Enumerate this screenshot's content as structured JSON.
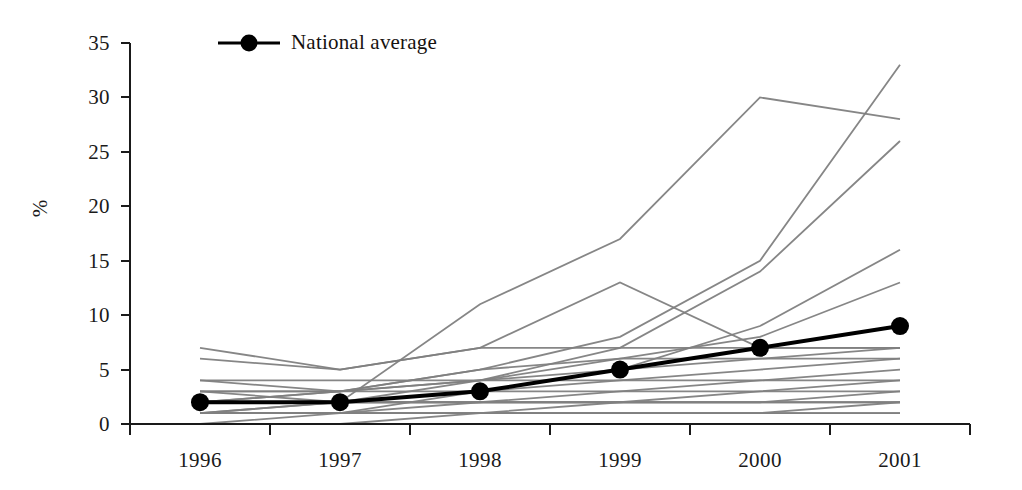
{
  "legend": {
    "position": "top-left-inside",
    "entries": [
      {
        "label": "National average",
        "color": "#000000",
        "marker": "filled-circle"
      }
    ]
  },
  "axes": {
    "ylabel": "%",
    "xlabel": "",
    "yticks": [
      "0",
      "5",
      "10",
      "15",
      "20",
      "25",
      "30",
      "35"
    ],
    "xticks": [
      "1996",
      "1997",
      "1998",
      "1999",
      "2000",
      "2001"
    ]
  },
  "chart_data": {
    "type": "line",
    "title": "",
    "subtitle": "",
    "xlabel": "",
    "ylabel": "%",
    "x": [
      "1996",
      "1997",
      "1998",
      "1999",
      "2000",
      "2001"
    ],
    "ylim": [
      0,
      35
    ],
    "xlim": [
      "1996",
      "2001"
    ],
    "ytick_step": 5,
    "grid": false,
    "legend_position": "top-left-inside",
    "annotations": [],
    "series": [
      {
        "name": "National average",
        "color": "#000000",
        "emphasis": "highlight",
        "marker": "filled-circle",
        "values": [
          2,
          2,
          3,
          5,
          7,
          9
        ]
      },
      {
        "name": "Region 1",
        "color": "#808080",
        "emphasis": "background",
        "marker": "none",
        "values": [
          1,
          2,
          11,
          17,
          30,
          28
        ]
      },
      {
        "name": "Region 2",
        "color": "#808080",
        "emphasis": "background",
        "marker": "none",
        "values": [
          2,
          3,
          5,
          8,
          15,
          33
        ]
      },
      {
        "name": "Region 3",
        "color": "#808080",
        "emphasis": "background",
        "marker": "none",
        "values": [
          3,
          3,
          4,
          7,
          14,
          26
        ]
      },
      {
        "name": "Region 4",
        "color": "#808080",
        "emphasis": "background",
        "marker": "none",
        "values": [
          1,
          1,
          3,
          5,
          9,
          16
        ]
      },
      {
        "name": "Region 5",
        "color": "#808080",
        "emphasis": "background",
        "marker": "none",
        "values": [
          2,
          2,
          4,
          6,
          8,
          13
        ]
      },
      {
        "name": "Region 6",
        "color": "#808080",
        "emphasis": "background",
        "marker": "none",
        "values": [
          7,
          5,
          7,
          13,
          7,
          7
        ]
      },
      {
        "name": "Region 7",
        "color": "#808080",
        "emphasis": "background",
        "marker": "none",
        "values": [
          6,
          5,
          7,
          7,
          7,
          7
        ]
      },
      {
        "name": "Region 8",
        "color": "#808080",
        "emphasis": "background",
        "marker": "none",
        "values": [
          4,
          3,
          5,
          6,
          6,
          6
        ]
      },
      {
        "name": "Region 9",
        "color": "#808080",
        "emphasis": "background",
        "marker": "none",
        "values": [
          4,
          4,
          4,
          5,
          6,
          7
        ]
      },
      {
        "name": "Region 10",
        "color": "#808080",
        "emphasis": "background",
        "marker": "none",
        "values": [
          3,
          3,
          4,
          4,
          5,
          6
        ]
      },
      {
        "name": "Region 11",
        "color": "#808080",
        "emphasis": "background",
        "marker": "none",
        "values": [
          3,
          2,
          3,
          4,
          4,
          5
        ]
      },
      {
        "name": "Region 12",
        "color": "#808080",
        "emphasis": "background",
        "marker": "none",
        "values": [
          2,
          3,
          3,
          3,
          4,
          4
        ]
      },
      {
        "name": "Region 13",
        "color": "#808080",
        "emphasis": "background",
        "marker": "none",
        "values": [
          2,
          2,
          2,
          3,
          3,
          4
        ]
      },
      {
        "name": "Region 14",
        "color": "#808080",
        "emphasis": "background",
        "marker": "none",
        "values": [
          2,
          2,
          2,
          2,
          2,
          3
        ]
      },
      {
        "name": "Region 15",
        "color": "#808080",
        "emphasis": "background",
        "marker": "none",
        "values": [
          1,
          2,
          2,
          2,
          3,
          3
        ]
      },
      {
        "name": "Region 16",
        "color": "#808080",
        "emphasis": "background",
        "marker": "none",
        "values": [
          1,
          1,
          2,
          2,
          2,
          2
        ]
      },
      {
        "name": "Region 17",
        "color": "#808080",
        "emphasis": "background",
        "marker": "none",
        "values": [
          1,
          1,
          1,
          2,
          2,
          2
        ]
      },
      {
        "name": "Region 18",
        "color": "#808080",
        "emphasis": "background",
        "marker": "none",
        "values": [
          1,
          1,
          1,
          1,
          1,
          2
        ]
      },
      {
        "name": "Region 19",
        "color": "#808080",
        "emphasis": "background",
        "marker": "none",
        "values": [
          0,
          1,
          1,
          1,
          1,
          1
        ]
      },
      {
        "name": "Region 20",
        "color": "#808080",
        "emphasis": "background",
        "marker": "none",
        "values": [
          0,
          0,
          1,
          1,
          1,
          1
        ]
      }
    ]
  },
  "style": {
    "axis_color": "#1a1a1a",
    "background": "#ffffff",
    "highlight_color": "#000000",
    "background_series_color": "#808080"
  }
}
